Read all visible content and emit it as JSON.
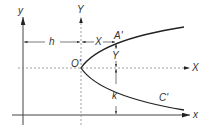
{
  "diagram": {
    "type": "parabola translation of axes",
    "labels": {
      "y_axis": "y",
      "Y_axis": "Y",
      "x_axis": "x",
      "X_axis": "X",
      "origin_prime": "O'",
      "point_A": "A'",
      "curve_C": "C'",
      "h": "h",
      "k": "k",
      "X_dim": "X",
      "Y_dim": "Y"
    },
    "colors": {
      "line": "#333333",
      "dashed": "#888888",
      "curve": "#222222"
    }
  }
}
